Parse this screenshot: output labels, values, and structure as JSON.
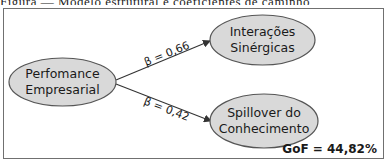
{
  "caption": {
    "text": "Figura — Modelo estrutural e coeficientes de caminho"
  },
  "colors": {
    "node_fill": "#d9d9d9",
    "node_stroke": "#555555",
    "edge": "#333333",
    "frame": "#707070"
  },
  "nodes": [
    {
      "id": "performance",
      "lines": [
        "Perfomance",
        "Empresarial"
      ]
    },
    {
      "id": "interacoes",
      "lines": [
        "Interações",
        "Sinérgicas"
      ]
    },
    {
      "id": "spillover",
      "lines": [
        "Spillover do",
        "Conhecimento"
      ]
    }
  ],
  "edges": [
    {
      "from": "performance",
      "to": "interacoes",
      "label": "β = 0,66"
    },
    {
      "from": "performance",
      "to": "spillover",
      "label": "β = 0,42"
    }
  ],
  "fit": {
    "label": "GoF = 44,82%"
  }
}
